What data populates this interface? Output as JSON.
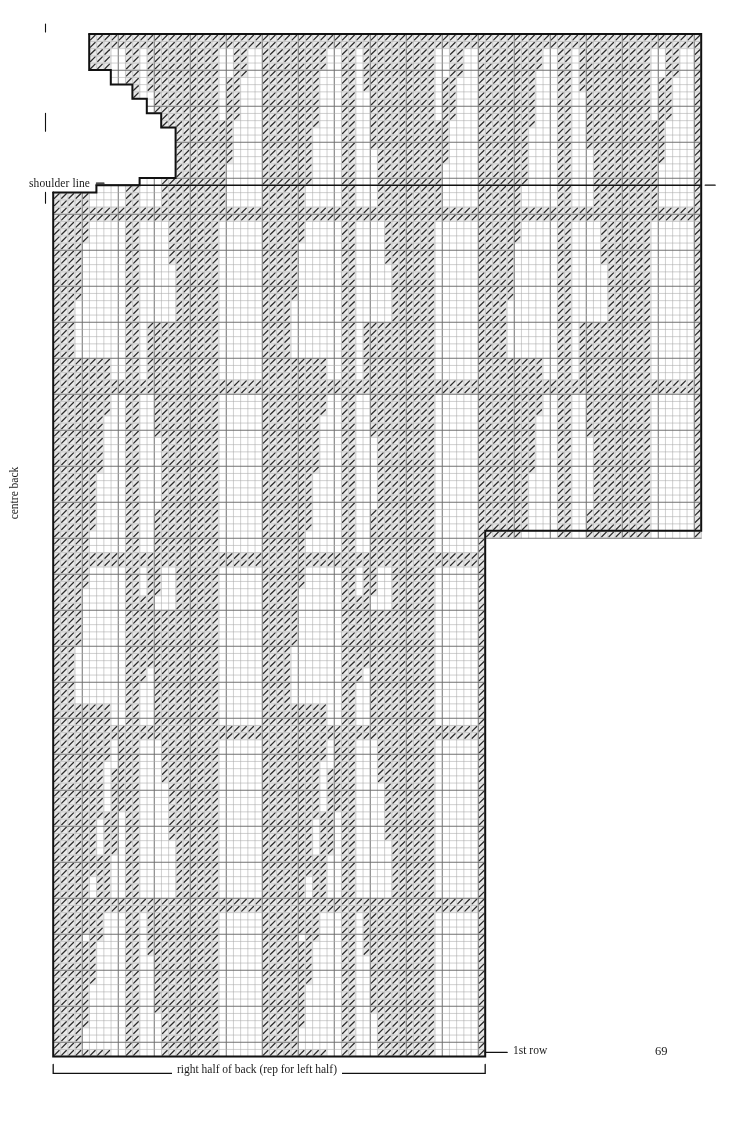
{
  "document": {
    "type": "knitting-stitch-chart",
    "page_number": "69",
    "title": "right half of back (rep for left half)"
  },
  "labels": {
    "shoulder_line": "shoulder line",
    "centre_back": "centre back",
    "first_row": "1st row",
    "repeat": "right half of back (rep for left half)",
    "page": "69"
  },
  "colors": {
    "ink": "#1a1a1a",
    "grid_light": "#a8a8a8",
    "grid_heavy": "#6a6a6a",
    "outline": "#111111",
    "cell_fill": "#e9e9e9",
    "slash": "#2b2b2b",
    "paper": "#ffffff"
  },
  "chart_data": {
    "type": "heatmap",
    "title": "right half of back (rep for left half)",
    "xlabel": "",
    "ylabel": "centre back",
    "grid": true,
    "legend": "none",
    "cell_px": 7.2,
    "heavy_line_every": 5,
    "origin": {
      "x": 46,
      "y": 34
    },
    "cols": 91,
    "rows": 142,
    "symbols": {
      "0": "plain (blank square)",
      "1": "patterned (diagonal slash)"
    },
    "regions": [
      {
        "name": "upper-body-with-neck",
        "row_start": 0,
        "row_end": 20,
        "col_start": 0,
        "col_end": 91
      },
      {
        "name": "yoke-sleeve-extension",
        "row_start": 21,
        "row_end": 69,
        "col_start": 0,
        "col_end": 91
      },
      {
        "name": "lower-body",
        "row_start": 70,
        "row_end": 141,
        "col_start": 0,
        "col_end": 61
      }
    ],
    "outline_path_notes": [
      "neck notch stepped cut-out at top-left spanning cols 0-24, rows 0-20",
      "shoulder line at row 21 across full width",
      "sleeve/armhole step-down at col 61, row 69",
      "lower body right edge at col 61 down to 1st row",
      "1st row is the bottom edge of the chart"
    ],
    "annotations": [
      {
        "text": "shoulder line",
        "x": 29,
        "y": 177,
        "anchor": "left"
      },
      {
        "text": "centre back",
        "x": 14,
        "y": 487,
        "anchor": "rotated"
      },
      {
        "text": "1st row",
        "x": 513,
        "y": 1044,
        "anchor": "left"
      },
      {
        "text": "right half of back (rep for left half)",
        "x": 172,
        "y": 1063,
        "anchor": "center"
      }
    ]
  }
}
